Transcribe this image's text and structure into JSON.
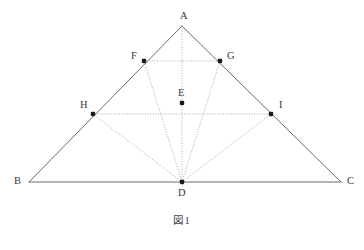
{
  "figure": {
    "caption": "図1",
    "type": "geometry-diagram"
  },
  "style": {
    "solid_line_color": "#6b6b6b",
    "dotted_line_color": "#9a9a9a",
    "point_color": "#1a1a1a",
    "label_color": "#3a3a3a",
    "background_color": "#ffffff"
  },
  "chart_data": {
    "type": "scatter",
    "title": "図1",
    "xlabel": "",
    "ylabel": "",
    "xlim": [
      0,
      364
    ],
    "ylim": [
      250,
      0
    ],
    "grid": false,
    "legend": null,
    "points": [
      {
        "name": "A",
        "x": 182,
        "y": 26,
        "label_x": 180,
        "label_y": 11,
        "marker": false,
        "on": "apex"
      },
      {
        "name": "B",
        "x": 29,
        "y": 182,
        "label_x": 14,
        "label_y": 176,
        "marker": false,
        "on": "base-left"
      },
      {
        "name": "C",
        "x": 341,
        "y": 182,
        "label_x": 347,
        "label_y": 176,
        "marker": false,
        "on": "base-right"
      },
      {
        "name": "D",
        "x": 182,
        "y": 182,
        "label_x": 178,
        "label_y": 188,
        "marker": true,
        "on": "BC"
      },
      {
        "name": "E",
        "x": 182,
        "y": 103,
        "label_x": 178,
        "label_y": 88,
        "marker": true,
        "on": "interior"
      },
      {
        "name": "F",
        "x": 144,
        "y": 61,
        "label_x": 131,
        "label_y": 51,
        "marker": true,
        "on": "AB"
      },
      {
        "name": "G",
        "x": 220,
        "y": 61,
        "label_x": 227,
        "label_y": 51,
        "marker": true,
        "on": "AC"
      },
      {
        "name": "H",
        "x": 93,
        "y": 114,
        "label_x": 80,
        "label_y": 100,
        "marker": true,
        "on": "AB"
      },
      {
        "name": "I",
        "x": 271,
        "y": 114,
        "label_x": 279,
        "label_y": 100,
        "marker": true,
        "on": "AC"
      }
    ],
    "segments": [
      {
        "name": "AB",
        "from": "A",
        "to": "B",
        "style": "solid"
      },
      {
        "name": "AC",
        "from": "A",
        "to": "C",
        "style": "solid"
      },
      {
        "name": "BC",
        "from": "B",
        "to": "C",
        "style": "solid"
      },
      {
        "name": "AD",
        "from": "A",
        "to": "D",
        "style": "dotted"
      },
      {
        "name": "FG",
        "from": "F",
        "to": "G",
        "style": "dotted"
      },
      {
        "name": "HI",
        "from": "H",
        "to": "I",
        "style": "dotted"
      },
      {
        "name": "DF",
        "from": "D",
        "to": "F",
        "style": "dotted"
      },
      {
        "name": "DG",
        "from": "D",
        "to": "G",
        "style": "dotted"
      },
      {
        "name": "DH",
        "from": "D",
        "to": "H",
        "style": "dotted"
      },
      {
        "name": "DI",
        "from": "D",
        "to": "I",
        "style": "dotted"
      }
    ]
  }
}
